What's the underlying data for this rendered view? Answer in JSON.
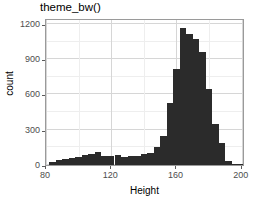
{
  "chart_data": {
    "type": "bar",
    "title": "theme_bw()",
    "xlabel": "Height",
    "ylabel": "count",
    "xlim": [
      80,
      202
    ],
    "ylim": [
      0,
      1250
    ],
    "grid": true,
    "legend": null,
    "binwidth": 4,
    "x_ticks": [
      80,
      120,
      160,
      200
    ],
    "y_ticks": [
      0,
      300,
      600,
      900,
      1200
    ],
    "x_tick_labels": [
      "80",
      "120",
      "160",
      "200"
    ],
    "y_tick_labels": [
      "0",
      "300",
      "600",
      "900",
      "1200"
    ],
    "bar_color": "#2b2b2b",
    "panel_border_color": "#9a9a9a",
    "grid_color": "#d6d6d6",
    "bins": [
      {
        "x0": 82,
        "x1": 86,
        "center": 84,
        "value": 22
      },
      {
        "x0": 86,
        "x1": 90,
        "center": 88,
        "value": 45
      },
      {
        "x0": 90,
        "x1": 94,
        "center": 92,
        "value": 48
      },
      {
        "x0": 94,
        "x1": 98,
        "center": 96,
        "value": 60
      },
      {
        "x0": 98,
        "x1": 102,
        "center": 100,
        "value": 72
      },
      {
        "x0": 102,
        "x1": 106,
        "center": 104,
        "value": 88
      },
      {
        "x0": 106,
        "x1": 110,
        "center": 108,
        "value": 95
      },
      {
        "x0": 110,
        "x1": 114,
        "center": 112,
        "value": 110
      },
      {
        "x0": 114,
        "x1": 118,
        "center": 116,
        "value": 78
      },
      {
        "x0": 118,
        "x1": 122,
        "center": 120,
        "value": 80
      },
      {
        "x0": 122,
        "x1": 126,
        "center": 124,
        "value": 88
      },
      {
        "x0": 126,
        "x1": 130,
        "center": 128,
        "value": 72
      },
      {
        "x0": 130,
        "x1": 134,
        "center": 132,
        "value": 75
      },
      {
        "x0": 134,
        "x1": 138,
        "center": 136,
        "value": 80
      },
      {
        "x0": 138,
        "x1": 142,
        "center": 140,
        "value": 90
      },
      {
        "x0": 142,
        "x1": 146,
        "center": 144,
        "value": 105
      },
      {
        "x0": 146,
        "x1": 150,
        "center": 148,
        "value": 150
      },
      {
        "x0": 150,
        "x1": 154,
        "center": 152,
        "value": 245
      },
      {
        "x0": 154,
        "x1": 158,
        "center": 156,
        "value": 530
      },
      {
        "x0": 158,
        "x1": 162,
        "center": 160,
        "value": 820
      },
      {
        "x0": 162,
        "x1": 166,
        "center": 164,
        "value": 1165
      },
      {
        "x0": 166,
        "x1": 170,
        "center": 168,
        "value": 1110
      },
      {
        "x0": 170,
        "x1": 174,
        "center": 172,
        "value": 1075
      },
      {
        "x0": 174,
        "x1": 178,
        "center": 176,
        "value": 960
      },
      {
        "x0": 178,
        "x1": 182,
        "center": 180,
        "value": 645
      },
      {
        "x0": 182,
        "x1": 186,
        "center": 184,
        "value": 345
      },
      {
        "x0": 186,
        "x1": 190,
        "center": 188,
        "value": 190
      },
      {
        "x0": 190,
        "x1": 194,
        "center": 192,
        "value": 38
      },
      {
        "x0": 194,
        "x1": 198,
        "center": 196,
        "value": 10
      },
      {
        "x0": 198,
        "x1": 202,
        "center": 200,
        "value": 6
      }
    ]
  }
}
